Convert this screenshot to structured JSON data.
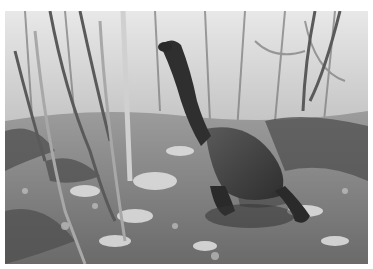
{
  "image": {
    "subject": "giant tortoise in forest",
    "description": "Greyscale photograph of a giant tortoise with a long outstretched neck standing among thin trees and ferns on a dappled, sunlit forest floor",
    "palette": {
      "background": "#ffffff",
      "sky_haze": "#e6e6e6",
      "foliage_light": "#bdbdbd",
      "foliage_mid": "#8a8a8a",
      "foliage_dark": "#4a4a4a",
      "tortoise": "#3a3a3a",
      "ground_light": "#d8d8d8",
      "ground_dark": "#555555"
    }
  }
}
